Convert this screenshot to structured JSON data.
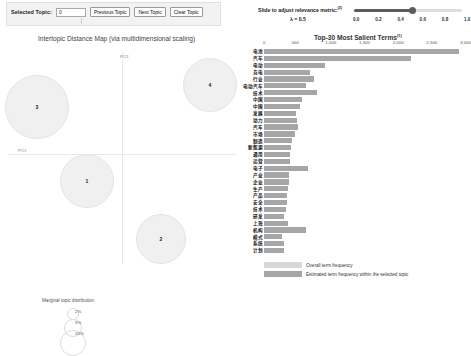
{
  "toolbar": {
    "selected_topic_label": "Selected Topic:",
    "selected_topic_value": "0",
    "previous_topic_label": "Previous Topic",
    "next_topic_label": "Next Topic",
    "clear_topic_label": "Clear Topic"
  },
  "slider": {
    "label": "Slide to adjust relevance metric:",
    "label_superscript": "(2)",
    "lambda_text": "λ = 0.5",
    "lambda_value": 0.5,
    "ticks": [
      "0.0",
      "0.2",
      "0.4",
      "0.6",
      "0.8",
      "1.0"
    ]
  },
  "left_panel": {
    "title": "Intertopic Distance Map (via multidimensional scaling)",
    "axis_x_label": "PC1",
    "axis_y_label": "PC2",
    "marginal_label": "Marginal topic distribution",
    "marginal_sizes": [
      "2%",
      "5%",
      "10%"
    ],
    "topics": [
      {
        "id": "3",
        "cx": 36,
        "cy": 60,
        "r": 31
      },
      {
        "id": "4",
        "cx": 209,
        "cy": 38,
        "r": 26
      },
      {
        "id": "1",
        "cx": 86,
        "cy": 134,
        "r": 26
      },
      {
        "id": "2",
        "cx": 160,
        "cy": 192,
        "r": 24
      }
    ]
  },
  "chart_data": {
    "type": "bar",
    "title": "Top-30 Most Salient Terms",
    "title_superscript": "(1)",
    "xlabel": "",
    "ylabel": "",
    "xlim": [
      0,
      3000
    ],
    "xticks": [
      0,
      500,
      1000,
      1500,
      2000,
      2500,
      3000
    ],
    "xticklabels": [
      "0",
      "500",
      "1,000",
      "1,500",
      "2,000",
      "2,500",
      "3,000"
    ],
    "grid": false,
    "legend_position": "bottom-left",
    "orientation": "horizontal",
    "categories": [
      "电池",
      "汽车",
      "电动",
      "充电",
      "行业",
      "电动汽车",
      "技术",
      "中国",
      "中国",
      "发展",
      "动力",
      "汽车",
      "市场",
      "制造",
      "新能源",
      "通用",
      "运营",
      "电子",
      "产业",
      "企业",
      "生产",
      "产品",
      "安全",
      "技术",
      "研发",
      "上海",
      "机构",
      "模式",
      "系统",
      "计划"
    ],
    "series": [
      {
        "name": "Overall term frequency",
        "values": [
          2890,
          2180,
          900,
          680,
          740,
          620,
          790,
          560,
          530,
          480,
          490,
          500,
          465,
          410,
          395,
          390,
          385,
          660,
          370,
          365,
          350,
          345,
          340,
          330,
          300,
          355,
          620,
          260,
          295,
          300
        ]
      },
      {
        "name": "Estimated term frequency within the selected topic",
        "values": [
          2890,
          2180,
          900,
          680,
          740,
          620,
          790,
          560,
          530,
          480,
          490,
          500,
          465,
          410,
          395,
          390,
          385,
          660,
          370,
          365,
          350,
          345,
          340,
          330,
          300,
          355,
          620,
          260,
          295,
          300
        ]
      }
    ],
    "legend": [
      {
        "label": "Overall term frequency",
        "color": "#d8d8d8"
      },
      {
        "label": "Estimated term frequency within the selected topic",
        "color": "#a6a6a6"
      }
    ]
  },
  "colors": {
    "bar_outer": "#d8d8d8",
    "bar_inner": "#a6a6a6",
    "circle_fill": "#f0f0f0",
    "circle_stroke": "#e4e4e4",
    "slider_track": "#5c5c5c"
  }
}
